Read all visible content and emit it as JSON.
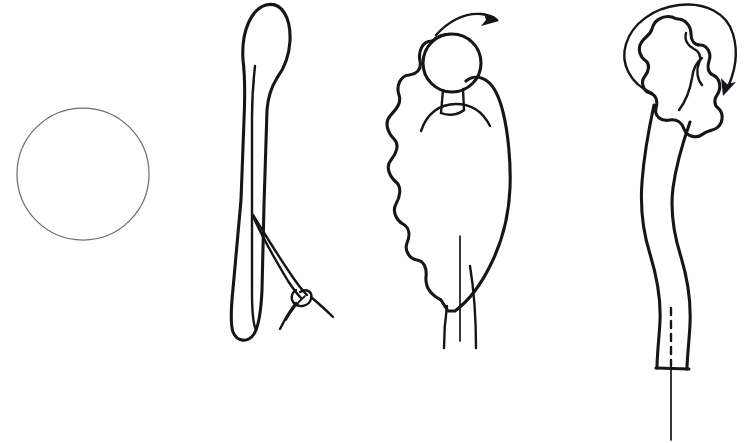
{
  "document": {
    "title": "Surgical Technique Line Drawing",
    "kind": "hand-drawn medical illustration",
    "background_color": "#ffffff",
    "ink_color": "#16151a",
    "faint_ink_color": "#6e6e76",
    "width": 747,
    "height": 443,
    "panel_count": 4,
    "has_text_labels": false
  },
  "panels": [
    {
      "index": 1,
      "name": "plain-circle",
      "description": "Empty thin-stroked circle outline",
      "stroke_color": "#6e6e76",
      "stroke_width": 1.25,
      "center": {
        "x": 83,
        "y": 174
      },
      "radius": 66,
      "elements": [
        "circle-outline"
      ]
    },
    {
      "index": 2,
      "name": "elongated-body-with-suture",
      "description": "Elongated club-shaped body with bulbous head, central lumen line, and a looped suture with knot exiting the lower right",
      "stroke_color": "#16151a",
      "bounds": {
        "x": 215,
        "y": 2,
        "width": 130,
        "height": 345
      },
      "elements": [
        "bulbous-head",
        "tapered-shaft",
        "center-lumen-line",
        "suture-thread-upper",
        "suture-thread-lower",
        "suture-knot",
        "suture-tail-left",
        "suture-tail-right"
      ]
    },
    {
      "index": 3,
      "name": "lobed-mass-with-nodule",
      "description": "Lobulated mass with a round nodule at top joined by a short rectangular stalk, a curved arrow above indicating rotation to the right, and a tapering stem below",
      "stroke_color": "#16151a",
      "bounds": {
        "x": 385,
        "y": 8,
        "width": 145,
        "height": 340
      },
      "elements": [
        "curved-arrow-right",
        "round-nodule",
        "connecting-stalk",
        "lobed-mass-outline",
        "internal-arc",
        "stem-left-wall",
        "stem-center-line",
        "stem-right-wall"
      ]
    },
    {
      "index": 4,
      "name": "curved-tube-with-flower-head",
      "description": "S-curved tube terminating in a cloud-lobed head, encircled by a large circular rotation arrow, with a clamped base marked by a dashed line and a thin needle extending downward",
      "stroke_color": "#16151a",
      "bounds": {
        "x": 605,
        "y": 2,
        "width": 142,
        "height": 440
      },
      "elements": [
        "circular-rotation-arrow",
        "flower-lobed-head",
        "head-inner-detail",
        "tube-left-wall",
        "tube-right-wall",
        "clamped-base",
        "dashed-center-line",
        "needle-shaft"
      ]
    }
  ],
  "annotations": {
    "arrow_panel_3": {
      "name": "curved-arrow-right",
      "direction": "clockwise-to-the-right",
      "meaning": "rotation of nodule"
    },
    "arrow_panel_4": {
      "name": "circular-rotation-arrow",
      "direction": "clockwise",
      "meaning": "full rotation of head"
    },
    "dashed_line_panel_4": {
      "name": "dashed-center-line",
      "meaning": "internal lumen / cut plane"
    }
  }
}
